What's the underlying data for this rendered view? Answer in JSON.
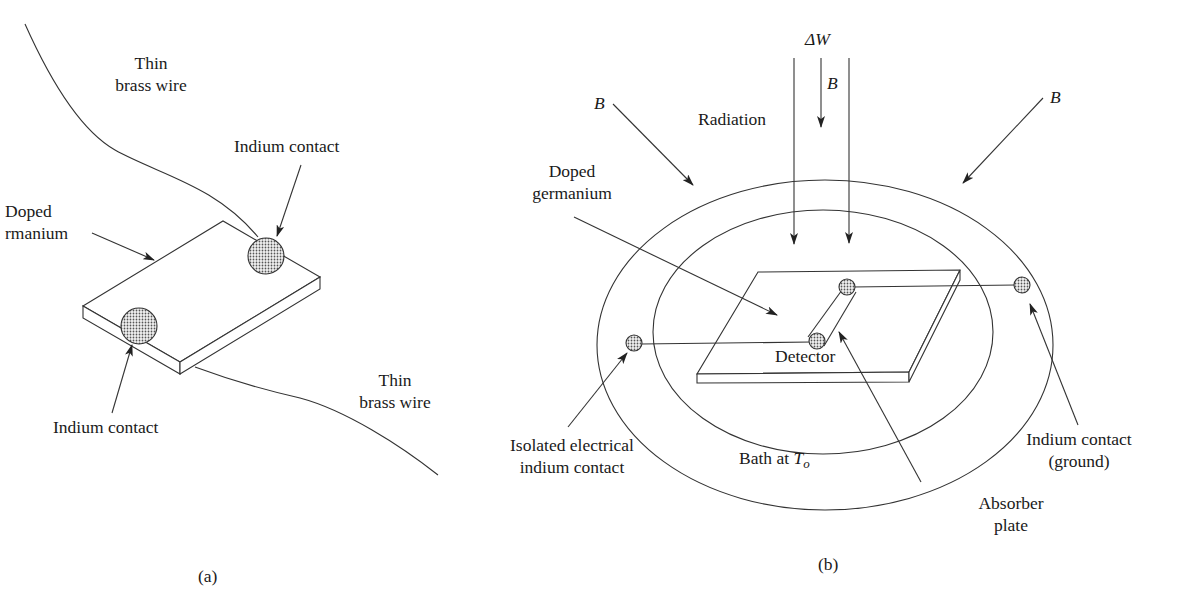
{
  "figure": {
    "panel_a": {
      "caption": "(a)",
      "labels": {
        "wire_top_line1": "Thin",
        "wire_top_line2": "brass wire",
        "indium_top": "Indium contact",
        "doped_line1": "Doped",
        "doped_line2": "rmanium",
        "indium_bottom": "Indium contact",
        "wire_bottom_line1": "Thin",
        "wire_bottom_line2": "brass wire"
      }
    },
    "panel_b": {
      "caption": "(b)",
      "labels": {
        "delta_w": "ΔW",
        "b_center": "B",
        "b_left": "B",
        "b_right": "B",
        "radiation": "Radiation",
        "doped_line1": "Doped",
        "doped_line2": "germanium",
        "detector": "Detector",
        "isolated_line1": "Isolated electrical",
        "isolated_line2": "indium contact",
        "bath_prefix": "Bath at ",
        "bath_var": "T",
        "bath_sub": "o",
        "absorber_line1": "Absorber",
        "absorber_line2": "plate",
        "ground_line1": "Indium contact",
        "ground_line2": "(ground)"
      }
    },
    "colors": {
      "line": "#333333",
      "text": "#1a1a1a",
      "dot_fill": "#cfcfcf"
    }
  }
}
